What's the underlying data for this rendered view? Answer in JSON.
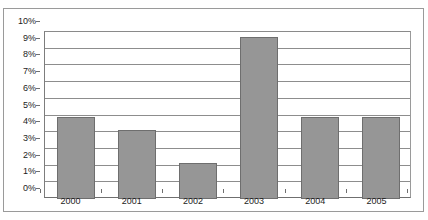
{
  "chart_data": {
    "type": "bar",
    "title": "",
    "xlabel": "",
    "ylabel": "",
    "categories": [
      "2000",
      "2001",
      "2002",
      "2003",
      "2004",
      "2005"
    ],
    "values": [
      4.9,
      4.15,
      2.15,
      9.7,
      4.9,
      4.9
    ],
    "value_format": "percent",
    "ylim": [
      0,
      10
    ],
    "ytick_values": [
      0,
      1,
      2,
      3,
      4,
      5,
      6,
      7,
      8,
      9,
      10
    ],
    "ytick_labels": [
      "0%",
      "1%",
      "2%",
      "3%",
      "4%",
      "5%",
      "6%",
      "7%",
      "8%",
      "9%",
      "10%"
    ],
    "grid": true,
    "grid_axis": "y",
    "legend": false,
    "legend_position": "none",
    "series": [
      {
        "name": "",
        "values": [
          4.9,
          4.15,
          2.15,
          9.7,
          4.9,
          4.9
        ]
      }
    ],
    "colors": {
      "bar_fill": "#969696",
      "bar_border": "#6e6e6e",
      "gridline": "#8d8d8d",
      "axis": "#6f6f6f",
      "plot_border": "#8a8a8a",
      "frame_border": "#9a9a9a",
      "text": "#1c1c1c",
      "background": "#ffffff"
    }
  }
}
